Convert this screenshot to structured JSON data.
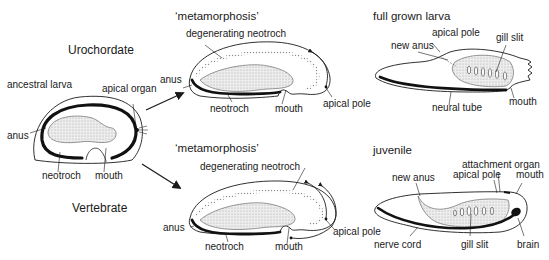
{
  "diagram": {
    "groups": {
      "urochordate": "Urochordate",
      "vertebrate": "Vertebrate"
    },
    "ancestral_larva": {
      "title": "ancestral larva",
      "labels": {
        "apical_organ": "apical organ",
        "anus": "anus",
        "neotroch": "neotroch",
        "mouth": "mouth"
      }
    },
    "uro_metamorphosis": {
      "title": "‘metamorphosis’",
      "labels": {
        "degenerating_neotroch": "degenerating neotroch",
        "anus": "anus",
        "neotroch": "neotroch",
        "mouth": "mouth",
        "apical_pole": "apical pole"
      }
    },
    "full_grown_larva": {
      "title": "full grown larva",
      "labels": {
        "apical_pole": "apical pole",
        "new_anus": "new anus",
        "gill_slit": "gill slit",
        "neural_tube": "neural tube",
        "mouth": "mouth"
      }
    },
    "vert_metamorphosis": {
      "title": "‘metamorphosis’",
      "labels": {
        "degenerating_neotroch": "degenerating neotroch",
        "anus": "anus",
        "neotroch": "neotroch",
        "mouth": "mouth",
        "apical_pole": "apical pole"
      }
    },
    "juvenile": {
      "title": "juvenile",
      "labels": {
        "attachment_organ": "attachment organ",
        "new_anus": "new anus",
        "apical_pole": "apical pole",
        "mouth": "mouth",
        "nerve_cord": "nerve cord",
        "gill_slit": "gill slit",
        "brain": "brain"
      }
    },
    "colors": {
      "line": "#1a1a1a",
      "gut_fill": "#e6e6e6",
      "stipple": "#b0b0b0",
      "background": "#ffffff"
    }
  }
}
